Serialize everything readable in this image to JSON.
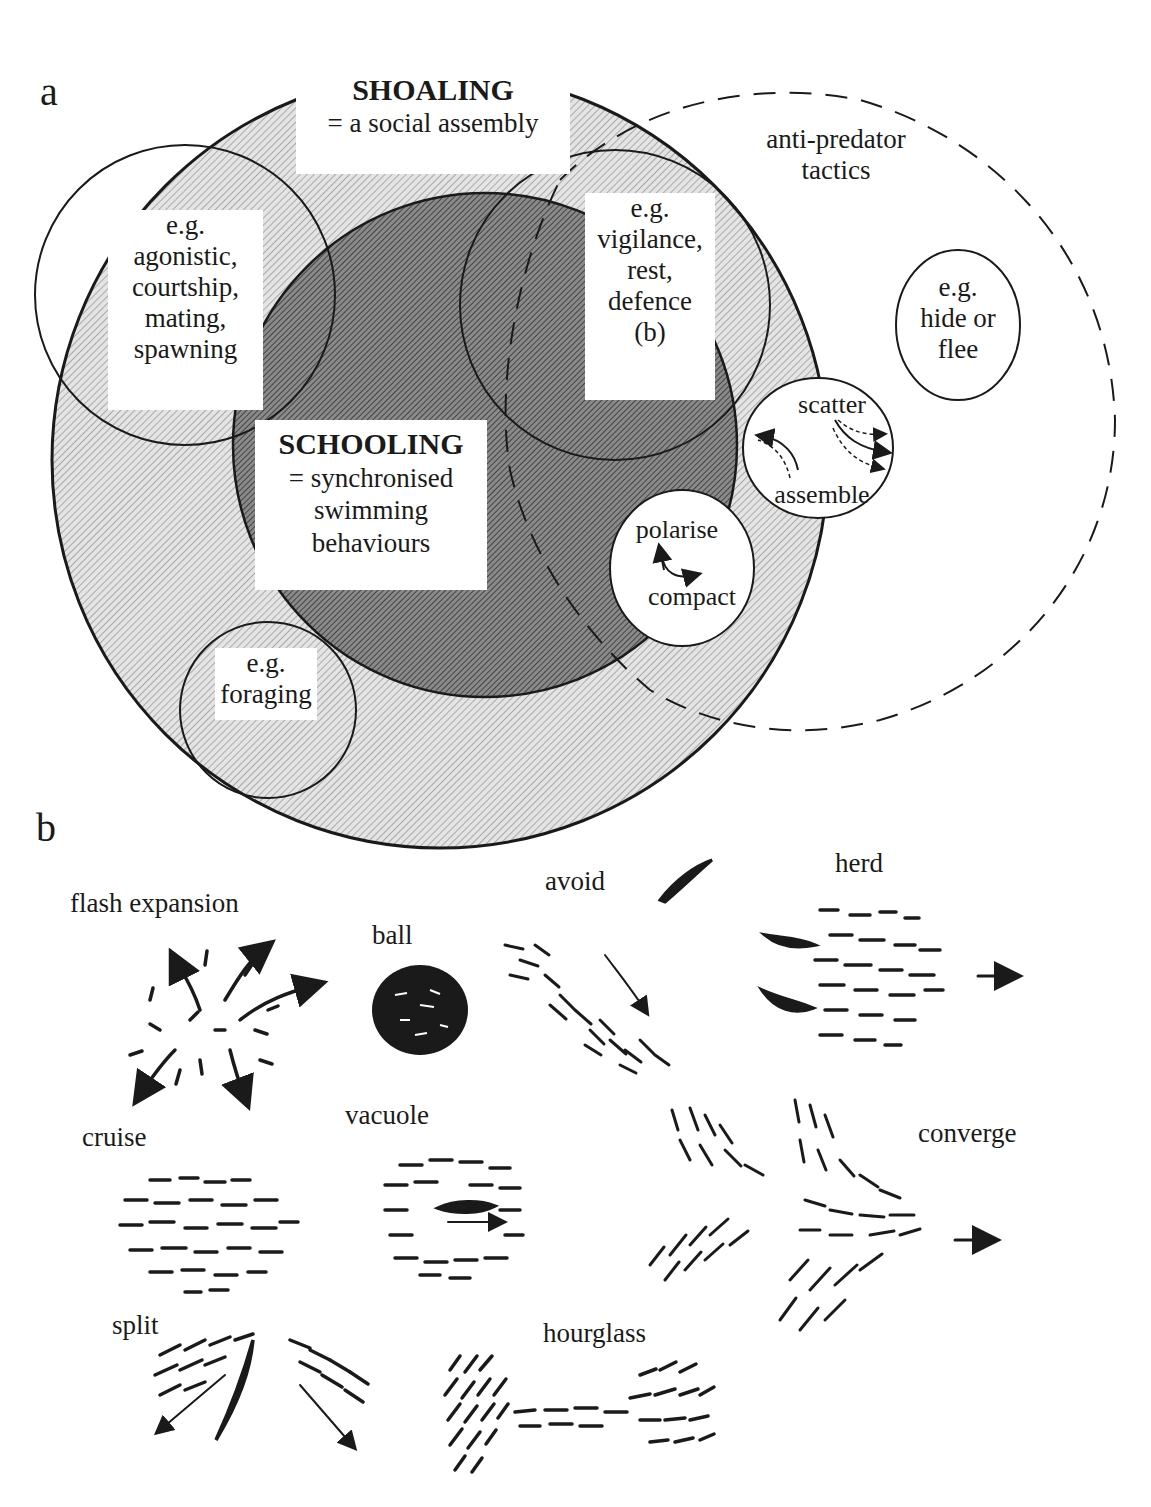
{
  "panel_a": {
    "label": "a",
    "shoaling": {
      "title": "SHOALING",
      "definition": "= a social assembly"
    },
    "schooling": {
      "title": "SCHOOLING",
      "definition_line1": "= synchronised",
      "definition_line2": "swimming",
      "definition_line3": "behaviours"
    },
    "social_circle": {
      "line1": "e.g.",
      "line2": "agonistic,",
      "line3": "courtship,",
      "line4": "mating,",
      "line5": "spawning"
    },
    "vigilance_circle": {
      "line1": "e.g.",
      "line2": "vigilance,",
      "line3": "rest,",
      "line4": "defence",
      "line5": "(b)"
    },
    "foraging_circle": {
      "line1": "e.g.",
      "line2": "foraging"
    },
    "anti_predator": {
      "line1": "anti-predator",
      "line2": "tactics"
    },
    "hide_circle": {
      "line1": "e.g.",
      "line2": "hide or",
      "line3": "flee"
    },
    "scatter_circle": {
      "top": "scatter",
      "bottom": "assemble"
    },
    "polarise_circle": {
      "top": "polarise",
      "bottom": "compact"
    }
  },
  "panel_b": {
    "label": "b",
    "behaviours": [
      {
        "id": "flash-expansion",
        "label": "flash  expansion"
      },
      {
        "id": "ball",
        "label": "ball"
      },
      {
        "id": "avoid",
        "label": "avoid"
      },
      {
        "id": "herd",
        "label": "herd"
      },
      {
        "id": "cruise",
        "label": "cruise"
      },
      {
        "id": "vacuole",
        "label": "vacuole"
      },
      {
        "id": "converge",
        "label": "converge"
      },
      {
        "id": "split",
        "label": "split"
      },
      {
        "id": "hourglass",
        "label": "hourglass"
      }
    ]
  },
  "colors": {
    "light_fill": "#d6d6d6",
    "dark_fill": "#6e6e6e",
    "stroke": "#1a1a1a",
    "background": "#ffffff"
  }
}
